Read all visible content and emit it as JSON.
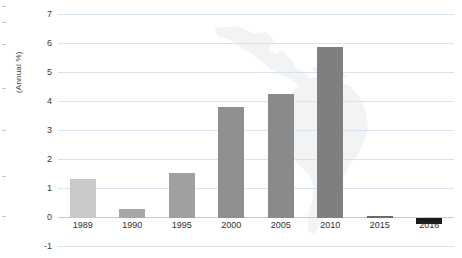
{
  "chart_data": {
    "type": "bar",
    "title": "",
    "subtitle": "",
    "xlabel": "",
    "ylabel": "(Annual %)",
    "categories": [
      "1989",
      "1990",
      "1995",
      "2000",
      "2005",
      "2010",
      "2015",
      "2016"
    ],
    "values": [
      1.35,
      0.3,
      1.55,
      3.8,
      4.25,
      5.85,
      0.08,
      -0.2
    ],
    "series": [
      {
        "name": "Annual %",
        "values": [
          1.35,
          0.3,
          1.55,
          3.8,
          4.25,
          5.85,
          0.08,
          -0.2
        ],
        "colors": [
          "#c9c9c9",
          "#a8a8a8",
          "#a0a0a0",
          "#8f8f8f",
          "#8a8a8a",
          "#7f7f7f",
          "#6a6a6a",
          "#1a1a1a"
        ]
      }
    ],
    "ylim": [
      -1,
      7
    ],
    "yticks": [
      -1,
      0,
      1,
      2,
      3,
      4,
      5,
      6,
      7
    ],
    "ytick_labels": [
      "-1",
      "0",
      "1",
      "2",
      "3",
      "4",
      "5",
      "6",
      "7"
    ],
    "grid": true,
    "gridline_color": "#d7e3ef",
    "zero_line_color": "#c2cdd8",
    "legend": "none",
    "background": "#ffffff",
    "watermark": "latin-america-map"
  },
  "axis": {
    "y_title": "(Annual %)"
  },
  "colors": {
    "plot_background": "#ffffff",
    "bar_default": "#8a8a8a",
    "bar_highlight": "#1a1a1a",
    "gridline": "#d7e3ef",
    "text": "#2f2f2f",
    "watermark": "#dfe3e6"
  }
}
